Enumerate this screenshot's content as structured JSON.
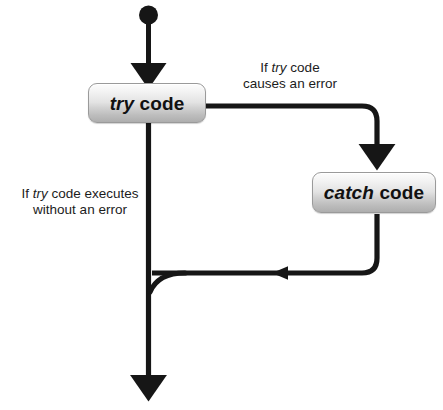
{
  "diagram": {
    "background_color": "#ffffff",
    "stroke_color": "#161616",
    "nodes": [
      {
        "id": "start",
        "type": "start-dot",
        "shape": "filled-circle"
      },
      {
        "id": "try",
        "type": "process",
        "keyword": "try",
        "rest": " code",
        "full_text": "try code"
      },
      {
        "id": "catch",
        "type": "process",
        "keyword": "catch",
        "rest": " code",
        "full_text": "catch code"
      }
    ],
    "edge_labels": [
      {
        "id": "error-branch",
        "line1_pre": "If ",
        "line1_kw": "try",
        "line1_post": " code",
        "line2": "causes an error",
        "full_text": "If try code causes an error"
      },
      {
        "id": "success-branch",
        "line1_pre": "If ",
        "line1_kw": "try",
        "line1_post": " code executes",
        "line2": "without an error",
        "full_text": "If try code executes without an error"
      }
    ]
  }
}
